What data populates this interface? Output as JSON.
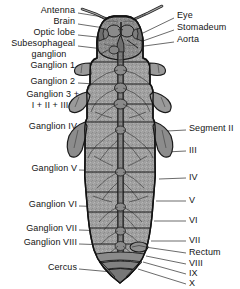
{
  "figure": {
    "type": "labelled-anatomical-diagram",
    "width": 240,
    "height": 289,
    "colors": {
      "background": "#ffffff",
      "body_fill": "#9d9d9d",
      "body_fill_light": "#b4b4b4",
      "body_fill_dark": "#7e7e7e",
      "outline": "#1f1f1f",
      "leader_line": "#2b2b2b",
      "text": "#141414"
    }
  },
  "labels_left": [
    {
      "text": "Antenna",
      "x": 75,
      "y": 10,
      "lx": 78,
      "ly": 15,
      "tx": 122,
      "ty": 20
    },
    {
      "text": "Brain",
      "x": 75,
      "y": 21,
      "lx": 78,
      "ly": 26,
      "tx": 124,
      "ty": 33
    },
    {
      "text": "Optic lobe",
      "x": 75,
      "y": 32,
      "lx": 78,
      "ly": 37,
      "tx": 115,
      "ty": 41
    },
    {
      "text": "Subesophageal",
      "x": 75,
      "y": 43,
      "lx": 78,
      "ly": 48,
      "tx": 112,
      "ty": 52
    },
    {
      "text": "ganglion",
      "x": 75,
      "y": 54,
      "lx": null,
      "ly": null,
      "tx": null,
      "ty": null
    },
    {
      "text": "Ganglion 1",
      "x": 75,
      "y": 64,
      "lx": 78,
      "ly": 69,
      "tx": 112,
      "ty": 70
    },
    {
      "text": "Ganglion 2",
      "x": 75,
      "y": 80,
      "lx": 78,
      "ly": 85,
      "tx": 112,
      "ty": 86
    },
    {
      "text": "Ganglion 3 +",
      "x": 80,
      "y": 93,
      "lx": 82,
      "ly": 98,
      "tx": 114,
      "ty": 101
    },
    {
      "text": "I + II + III",
      "x": 75,
      "y": 105,
      "lx": null,
      "ly": null,
      "tx": null,
      "ty": null
    },
    {
      "text": "Ganglion IV",
      "x": 77,
      "y": 125,
      "lx": 79,
      "ly": 130,
      "tx": 113,
      "ty": 130
    },
    {
      "text": "Ganglion V",
      "x": 77,
      "y": 167,
      "lx": 79,
      "ly": 172,
      "tx": 112,
      "ty": 172
    },
    {
      "text": "Ganglion VI",
      "x": 77,
      "y": 203,
      "lx": 79,
      "ly": 208,
      "tx": 110,
      "ty": 208
    },
    {
      "text": "Ganglion VII",
      "x": 77,
      "y": 227,
      "lx": 79,
      "ly": 232,
      "tx": 108,
      "ty": 232
    },
    {
      "text": "Ganglion VIII",
      "x": 77,
      "y": 241,
      "lx": 79,
      "ly": 246,
      "tx": 108,
      "ty": 246
    },
    {
      "text": "Cercus",
      "x": 77,
      "y": 266,
      "lx": 79,
      "ly": 270,
      "tx": 110,
      "ty": 272
    }
  ],
  "labels_right": [
    {
      "text": "Eye",
      "x": 177,
      "y": 15,
      "lx": 175,
      "ly": 20,
      "tx": 143,
      "ty": 34
    },
    {
      "text": "Stomadeum",
      "x": 177,
      "y": 27,
      "lx": 175,
      "ly": 32,
      "tx": 140,
      "ty": 43
    },
    {
      "text": "Aorta",
      "x": 177,
      "y": 39,
      "lx": 175,
      "ly": 44,
      "tx": 138,
      "ty": 48
    },
    {
      "text": "Segment II",
      "x": 189,
      "y": 127,
      "lx": 187,
      "ly": 131,
      "tx": 167,
      "ty": 131
    },
    {
      "text": "III",
      "x": 189,
      "y": 148,
      "lx": 187,
      "ly": 152,
      "tx": 166,
      "ty": 152
    },
    {
      "text": "IV",
      "x": 189,
      "y": 175,
      "lx": 187,
      "ly": 179,
      "tx": 160,
      "ty": 179
    },
    {
      "text": "V",
      "x": 189,
      "y": 198,
      "lx": 187,
      "ly": 202,
      "tx": 157,
      "ty": 202
    },
    {
      "text": "VI",
      "x": 189,
      "y": 218,
      "lx": 187,
      "ly": 222,
      "tx": 155,
      "ty": 222
    },
    {
      "text": "VII",
      "x": 189,
      "y": 238,
      "lx": 187,
      "ly": 242,
      "tx": 152,
      "ty": 242
    },
    {
      "text": "Rectum",
      "x": 189,
      "y": 250,
      "lx": 187,
      "ly": 254,
      "tx": 146,
      "ty": 247
    },
    {
      "text": "VIII",
      "x": 189,
      "y": 261,
      "lx": 187,
      "ly": 265,
      "tx": 147,
      "ty": 257
    },
    {
      "text": "IX",
      "x": 189,
      "y": 271,
      "lx": 187,
      "ly": 275,
      "tx": 144,
      "ty": 263
    },
    {
      "text": "X",
      "x": 189,
      "y": 281,
      "lx": 187,
      "ly": 283,
      "tx": 140,
      "ty": 270
    }
  ],
  "diagram_parts": [
    {
      "name": "antenna-left"
    },
    {
      "name": "antenna-right"
    },
    {
      "name": "head-capsule"
    },
    {
      "name": "compound-eye-left"
    },
    {
      "name": "compound-eye-right"
    },
    {
      "name": "brain"
    },
    {
      "name": "optic-lobe"
    },
    {
      "name": "subesophageal-ganglion"
    },
    {
      "name": "aorta"
    },
    {
      "name": "stomadeum"
    },
    {
      "name": "thoracic-ganglion-1"
    },
    {
      "name": "thoracic-ganglion-2"
    },
    {
      "name": "thoracic-ganglion-3"
    },
    {
      "name": "leg-base-left-1"
    },
    {
      "name": "leg-base-right-1"
    },
    {
      "name": "leg-base-left-2"
    },
    {
      "name": "leg-base-right-2"
    },
    {
      "name": "abdominal-ganglion-IV"
    },
    {
      "name": "abdominal-ganglion-V"
    },
    {
      "name": "abdominal-ganglion-VI"
    },
    {
      "name": "abdominal-ganglion-VII"
    },
    {
      "name": "abdominal-ganglion-VIII"
    },
    {
      "name": "ventral-nerve-cord"
    },
    {
      "name": "abdominal-segments"
    },
    {
      "name": "rectum"
    },
    {
      "name": "cercus-left"
    },
    {
      "name": "cercus-right"
    }
  ]
}
